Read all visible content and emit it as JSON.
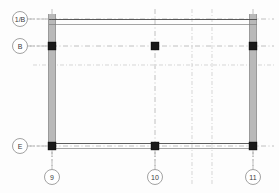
{
  "drawing": {
    "title": "Structural Framing Plan",
    "background_color": "#fdfdfd",
    "line_color": "#4a4a4a",
    "grid_color": "#b0b0b0",
    "wall_color": "#b9b9b9",
    "column_color": "#1a1a1a",
    "width": 279,
    "height": 193
  },
  "grid_bubbles": {
    "horizontal_axes": [
      {
        "id": "bubble-1B",
        "label": "1/B",
        "cx": 20,
        "cy": 19,
        "r": 7.5,
        "axis_y": 19
      },
      {
        "id": "bubble-B",
        "label": "B",
        "cx": 20,
        "cy": 46,
        "r": 7.5,
        "axis_y": 46
      },
      {
        "id": "bubble-E",
        "label": "E",
        "cx": 20,
        "cy": 146,
        "r": 7.5,
        "axis_y": 146
      }
    ],
    "vertical_axes": [
      {
        "id": "bubble-9",
        "label": "9",
        "cx": 52,
        "cy": 177,
        "r": 7.5,
        "axis_x": 52
      },
      {
        "id": "bubble-10",
        "label": "10",
        "cx": 155,
        "cy": 177,
        "r": 7.5,
        "axis_x": 155
      },
      {
        "id": "bubble-11",
        "label": "11",
        "cx": 253,
        "cy": 177,
        "r": 7.5,
        "axis_x": 253
      }
    ]
  },
  "gridlines": {
    "horizontal": [
      {
        "id": "gridline-h-1B",
        "y": 19,
        "x1": 30,
        "x2": 274,
        "weight": "primary"
      },
      {
        "id": "gridline-h-B",
        "y": 46,
        "x1": 30,
        "x2": 274,
        "weight": "primary"
      },
      {
        "id": "gridline-h-unlabeled",
        "y": 65,
        "x1": 33,
        "x2": 274,
        "weight": "secondary"
      },
      {
        "id": "gridline-h-E",
        "y": 146,
        "x1": 30,
        "x2": 274,
        "weight": "primary"
      }
    ],
    "vertical": [
      {
        "id": "gridline-v-9",
        "x": 52,
        "y1": 9,
        "y2": 170,
        "weight": "primary"
      },
      {
        "id": "gridline-v-10",
        "x": 155,
        "y1": 9,
        "y2": 170,
        "weight": "primary"
      },
      {
        "id": "gridline-v-mid-a",
        "x": 192,
        "y1": 9,
        "y2": 185,
        "weight": "secondary"
      },
      {
        "id": "gridline-v-mid-b",
        "x": 212,
        "y1": 9,
        "y2": 185,
        "weight": "secondary"
      },
      {
        "id": "gridline-v-11",
        "x": 253,
        "y1": 9,
        "y2": 170,
        "weight": "primary"
      }
    ]
  },
  "walls": [
    {
      "id": "wall-left-vertical",
      "x": 48,
      "y": 14,
      "width": 8,
      "height": 136,
      "orientation": "vertical"
    },
    {
      "id": "wall-right-vertical",
      "x": 249,
      "y": 14,
      "width": 8,
      "height": 136,
      "orientation": "vertical"
    }
  ],
  "beams": [
    {
      "id": "beam-top",
      "x1": 50,
      "y1": 22,
      "x2": 256,
      "y2": 22,
      "offset": 4
    },
    {
      "id": "beam-bottom",
      "x1": 50,
      "y1": 146,
      "x2": 256,
      "y2": 146,
      "offset": 4
    }
  ],
  "columns": [
    {
      "id": "column-B-9",
      "cx": 52,
      "cy": 46,
      "size": 8
    },
    {
      "id": "column-B-10",
      "cx": 155,
      "cy": 46,
      "size": 8
    },
    {
      "id": "column-B-11",
      "cx": 253,
      "cy": 46,
      "size": 8
    },
    {
      "id": "column-E-9",
      "cx": 52,
      "cy": 146,
      "size": 8
    },
    {
      "id": "column-E-10",
      "cx": 155,
      "cy": 146,
      "size": 8
    },
    {
      "id": "column-E-11",
      "cx": 253,
      "cy": 146,
      "size": 8
    }
  ]
}
